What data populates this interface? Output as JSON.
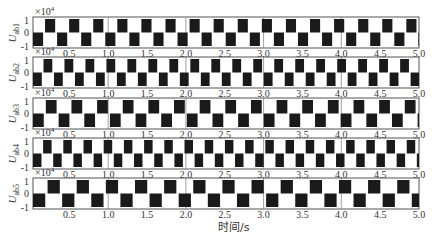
{
  "chart_data": {
    "type": "line",
    "title": "",
    "xlabel": "时间/s",
    "x_ticks": [
      "0.5",
      "1.0",
      "1.5",
      "2.0",
      "2.5",
      "3.0",
      "3.5",
      "4.0",
      "4.5",
      "5.0"
    ],
    "xlim": [
      0.04,
      5.0
    ],
    "y_ticks": [
      "-1",
      "0",
      "1"
    ],
    "ylim": [
      -1.2,
      1.2
    ],
    "y_scale_note": "×10^4",
    "grid": "vertical lines at integer seconds",
    "waveform": "three-level square wave (+1, 0, -1) ×10^4 V",
    "panels": [
      {
        "ylabel_main": "U",
        "ylabel_sub": "ab1",
        "scale": "×10",
        "exp": "4",
        "period_s": 0.31,
        "duty": 0.42,
        "phase_s": 0.04,
        "show_xticks": true
      },
      {
        "ylabel_main": "U",
        "ylabel_sub": "ab2",
        "scale": "×10",
        "exp": "4",
        "period_s": 0.27,
        "duty": 0.42,
        "phase_s": 0.05,
        "show_xticks": true
      },
      {
        "ylabel_main": "U",
        "ylabel_sub": "ab3",
        "scale": "×10",
        "exp": "4",
        "period_s": 0.33,
        "duty": 0.42,
        "phase_s": 0.06,
        "show_xticks": true
      },
      {
        "ylabel_main": "U",
        "ylabel_sub": "ab4",
        "scale": "×10",
        "exp": "4",
        "period_s": 0.26,
        "duty": 0.42,
        "phase_s": 0.05,
        "show_xticks": true
      },
      {
        "ylabel_main": "U",
        "ylabel_sub": "ab5",
        "scale": "",
        "exp": "",
        "period_s": 0.375,
        "duty": 0.42,
        "phase_s": 0.06,
        "show_xticks": true
      }
    ],
    "colors": {
      "wave": "#1a1a1a",
      "frame": "#555555",
      "grid": "#888888",
      "background": "#ffffff"
    }
  }
}
